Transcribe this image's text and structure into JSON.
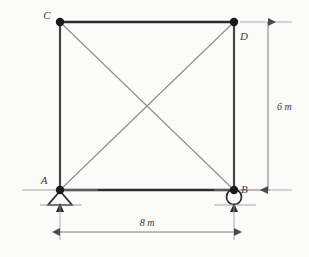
{
  "figure": {
    "type": "structural-truss-diagram",
    "background_color": "#fbfbfa",
    "member_color": "#2b2b2b",
    "brace_color": "#8a8a8a",
    "dimension_color": "#6e6e6e",
    "node_color": "#1a1a1a"
  },
  "nodes": [
    {
      "id": "C",
      "label": "C",
      "x": 60,
      "y": 22,
      "label_x": 47,
      "label_y": 19
    },
    {
      "id": "D",
      "label": "D",
      "x": 234,
      "y": 22,
      "label_x": 238,
      "label_y": 40
    },
    {
      "id": "A",
      "label": "A",
      "x": 60,
      "y": 190,
      "label_x": 44,
      "label_y": 184
    },
    {
      "id": "B",
      "label": "B",
      "x": 234,
      "y": 190,
      "label_x": 241,
      "label_y": 193
    }
  ],
  "members": [
    {
      "name": "top-chord-CD",
      "from": "C",
      "to": "D",
      "style": "chord"
    },
    {
      "name": "bottom-chord-AB",
      "from": "A",
      "to": "B",
      "style": "chord"
    },
    {
      "name": "left-post-CA",
      "from": "C",
      "to": "A",
      "style": "chord"
    },
    {
      "name": "right-post-DB",
      "from": "D",
      "to": "B",
      "style": "chord"
    },
    {
      "name": "diagonal-CB",
      "from": "C",
      "to": "B",
      "style": "brace"
    },
    {
      "name": "diagonal-AD",
      "from": "A",
      "to": "D",
      "style": "brace"
    }
  ],
  "supports": [
    {
      "at": "A",
      "kind": "pinned-support",
      "symbol": "triangle"
    },
    {
      "at": "B",
      "kind": "roller-support",
      "symbol": "circle"
    }
  ],
  "dimensions": [
    {
      "name": "width-dimension",
      "label": "8 m",
      "value": 8,
      "unit": "m",
      "orientation": "horizontal",
      "label_x": 147,
      "label_y": 226,
      "line_y": 232,
      "from_x": 60,
      "to_x": 234
    },
    {
      "name": "height-dimension",
      "label": "6 m",
      "value": 6,
      "unit": "m",
      "orientation": "vertical",
      "label_x": 277,
      "label_y": 110,
      "line_x": 268,
      "from_y": 22,
      "to_y": 190
    }
  ]
}
